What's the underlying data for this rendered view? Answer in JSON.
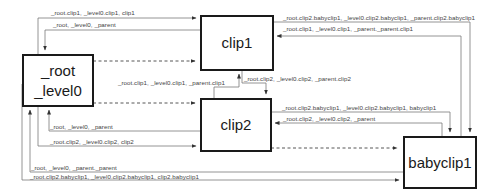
{
  "nodes": {
    "root": {
      "lines": [
        "_root",
        "_level0"
      ]
    },
    "clip1": {
      "label": "clip1"
    },
    "clip2": {
      "label": "clip2"
    },
    "babyclip1": {
      "label": "babyclip1"
    }
  },
  "edges": {
    "root_to_clip1": "_root.clip1, _level0.clip1, clip1",
    "clip1_to_root": "_root, _level0, _parent",
    "clip1_to_babyclip1": "_root.clip2.babyclip1, _level0.clip2.babyclip1, _parent.clip2.babyclip1",
    "babyclip1_to_clip1": "_root.clip1, _level0.clip1, _parent._parent.clip1",
    "clip2_to_clip1": "_root.clip1, _level0.clip1, _parent.clip1",
    "clip1_to_clip2": "_root.clip2, _level0.clip2, _parent.clip2",
    "clip2_to_babyclip1": "_root.clip2.babyclip1, _level0.clip2.babyclip1, babyclip1",
    "babyclip1_to_clip2": "_root.clip2, _level0.clip2, _parent",
    "clip2_to_root": "_root, _level0, _parent",
    "root_to_clip2": "_root.clip2, _level0.clip2, clip2",
    "babyclip1_to_root": "_root, _level0, _parent._parent",
    "root_to_babyclip1": "_root.clip2.babyclip1, _level0.clip2.babyclip1, clip2.babyclip1"
  },
  "colors": {
    "line": "#6b6b6b",
    "box_border": "#1a1a1a",
    "text": "#444444"
  }
}
